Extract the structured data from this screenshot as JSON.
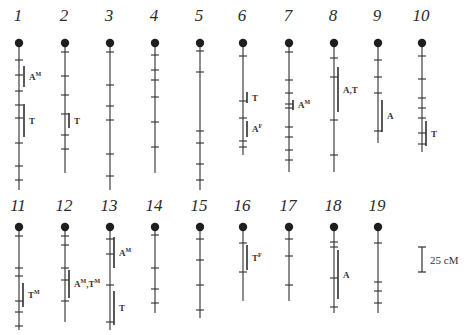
{
  "diagram": {
    "type": "linkage-map",
    "colors": {
      "ink": "#2f2f2f",
      "background": "#ffffff"
    },
    "scale_bar": {
      "label": "25 cM",
      "x": 422,
      "y_top": 247,
      "y_bottom": 272
    },
    "chromosomes": [
      {
        "id": "1",
        "x": 19,
        "label_y": 25,
        "top": 43,
        "end": 190,
        "ticks": [
          60,
          75,
          91,
          105,
          118,
          143,
          166,
          180
        ],
        "qtls": [
          {
            "label": "A",
            "sup": "M",
            "x": 24,
            "y1": 66,
            "y2": 87
          },
          {
            "label": "T",
            "sup": "",
            "x": 24,
            "y1": 104,
            "y2": 137
          }
        ]
      },
      {
        "id": "2",
        "x": 65,
        "label_y": 25,
        "top": 43,
        "end": 173,
        "ticks": [
          52,
          76,
          95,
          114,
          135,
          149
        ],
        "qtls": [
          {
            "label": "T",
            "sup": "",
            "x": 69,
            "y1": 113,
            "y2": 128
          }
        ]
      },
      {
        "id": "3",
        "x": 110,
        "label_y": 25,
        "top": 43,
        "end": 190,
        "ticks": [
          52,
          85,
          106,
          120,
          154,
          176
        ],
        "qtls": []
      },
      {
        "id": "4",
        "x": 155,
        "label_y": 25,
        "top": 43,
        "end": 173,
        "ticks": [
          55,
          70,
          80,
          97,
          122,
          147
        ],
        "qtls": []
      },
      {
        "id": "5",
        "x": 200,
        "label_y": 25,
        "top": 43,
        "end": 190,
        "ticks": [
          51,
          72,
          131,
          143,
          164,
          180
        ],
        "qtls": []
      },
      {
        "id": "6",
        "x": 243,
        "label_y": 25,
        "top": 43,
        "end": 155,
        "ticks": [
          56,
          101,
          118,
          141,
          147
        ],
        "qtls": [
          {
            "label": "T",
            "sup": "",
            "x": 247,
            "y1": 92,
            "y2": 103
          },
          {
            "label": "A",
            "sup": "F",
            "x": 247,
            "y1": 121,
            "y2": 137
          }
        ]
      },
      {
        "id": "7",
        "x": 289,
        "label_y": 25,
        "top": 43,
        "end": 172,
        "ticks": [
          52,
          80,
          93,
          104,
          108,
          127,
          137,
          150,
          160
        ],
        "qtls": [
          {
            "label": "A",
            "sup": "M",
            "x": 293,
            "y1": 100,
            "y2": 110
          }
        ]
      },
      {
        "id": "8",
        "x": 334,
        "label_y": 25,
        "top": 43,
        "end": 172,
        "ticks": [
          58,
          77,
          120,
          155
        ],
        "qtls": [
          {
            "label": "A,T",
            "sup": "",
            "x": 338,
            "y1": 67,
            "y2": 112
          }
        ]
      },
      {
        "id": "9",
        "x": 378,
        "label_y": 25,
        "top": 43,
        "end": 143,
        "ticks": [
          60,
          77,
          93,
          131
        ],
        "qtls": [
          {
            "label": "A",
            "sup": "",
            "x": 382,
            "y1": 100,
            "y2": 132
          }
        ]
      },
      {
        "id": "10",
        "x": 422,
        "label_y": 25,
        "top": 43,
        "end": 152,
        "ticks": [
          56,
          79,
          98,
          108,
          118,
          133,
          144
        ],
        "qtls": [
          {
            "label": "T",
            "sup": "",
            "x": 426,
            "y1": 121,
            "y2": 146
          }
        ]
      },
      {
        "id": "11",
        "x": 19,
        "label_y": 215,
        "top": 227,
        "end": 330,
        "ticks": [
          236,
          268,
          276,
          301,
          312,
          326
        ],
        "qtls": [
          {
            "label": "T",
            "sup": "M",
            "x": 23,
            "y1": 283,
            "y2": 307
          }
        ]
      },
      {
        "id": "12",
        "x": 65,
        "label_y": 215,
        "top": 227,
        "end": 322,
        "ticks": [
          236,
          245,
          268,
          280,
          301
        ],
        "qtls": [
          {
            "label": "A",
            "sup": "M",
            "extra": ",T",
            "extra_sup": "M",
            "x": 69,
            "y1": 270,
            "y2": 298
          }
        ]
      },
      {
        "id": "13",
        "x": 110,
        "label_y": 215,
        "top": 227,
        "end": 330,
        "ticks": [
          239,
          254,
          285,
          322
        ],
        "qtls": [
          {
            "label": "A",
            "sup": "M",
            "x": 114,
            "y1": 237,
            "y2": 268
          },
          {
            "label": "T",
            "sup": "",
            "x": 114,
            "y1": 291,
            "y2": 325
          }
        ]
      },
      {
        "id": "14",
        "x": 155,
        "label_y": 215,
        "top": 227,
        "end": 313,
        "ticks": [
          235,
          268,
          289,
          303
        ],
        "qtls": []
      },
      {
        "id": "15",
        "x": 200,
        "label_y": 215,
        "top": 227,
        "end": 318,
        "ticks": [
          239,
          260,
          285,
          310
        ],
        "qtls": []
      },
      {
        "id": "16",
        "x": 243,
        "label_y": 215,
        "top": 227,
        "end": 301,
        "ticks": [
          243,
          272
        ],
        "qtls": [
          {
            "label": "T",
            "sup": "F",
            "x": 247,
            "y1": 245,
            "y2": 270
          }
        ]
      },
      {
        "id": "17",
        "x": 289,
        "label_y": 215,
        "top": 227,
        "end": 301,
        "ticks": [
          239,
          256,
          285
        ],
        "qtls": []
      },
      {
        "id": "18",
        "x": 334,
        "label_y": 215,
        "top": 227,
        "end": 313,
        "ticks": [
          242,
          247,
          278,
          307
        ],
        "qtls": [
          {
            "label": "A",
            "sup": "",
            "x": 338,
            "y1": 250,
            "y2": 299
          }
        ]
      },
      {
        "id": "19",
        "x": 378,
        "label_y": 215,
        "top": 227,
        "end": 313,
        "ticks": [
          243,
          282,
          291,
          303
        ],
        "qtls": []
      }
    ]
  }
}
